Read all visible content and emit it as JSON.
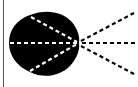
{
  "diagram": {
    "colors": {
      "background": "#ffffff",
      "shape": "#000000",
      "inner_rays": "#ffffff",
      "outer_rays": "#000000",
      "edge_line": "#555555"
    },
    "focal_point": {
      "x": 78,
      "y": 43
    },
    "outer_rays": [
      {
        "to_x": 134,
        "to_y": 13
      },
      {
        "to_x": 137,
        "to_y": 43
      },
      {
        "to_x": 134,
        "to_y": 74
      }
    ],
    "inner_rays": [
      {
        "from_x": 31,
        "from_y": 17
      },
      {
        "from_x": 9,
        "from_y": 43
      },
      {
        "from_x": 30,
        "from_y": 71
      }
    ]
  }
}
